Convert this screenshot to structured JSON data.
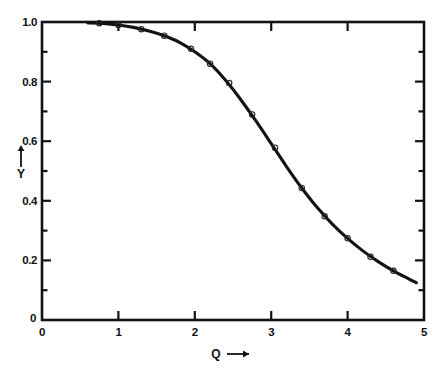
{
  "figure": {
    "background_color": "#ffffff",
    "line_color": "#121212",
    "marker_color": "#262626",
    "axis_color": "#121212"
  },
  "chart_data": {
    "type": "line",
    "title": "",
    "subtitle": "",
    "xlabel": "Q",
    "xlabel_suffix": "⟶",
    "ylabel": "Y",
    "ylabel_suffix": "⟶",
    "xlim": [
      0,
      5
    ],
    "ylim": [
      0,
      1.0
    ],
    "grid": false,
    "legend": null,
    "x_ticks": [
      0,
      1,
      2,
      3,
      4,
      5
    ],
    "x_tick_labels": [
      "0",
      "1",
      "2",
      "3",
      "4",
      "5"
    ],
    "x_minor_ticks": [
      0.5,
      1.5,
      2.5,
      3.5,
      4.5
    ],
    "y_ticks": [
      0,
      0.2,
      0.4,
      0.6,
      0.8,
      1.0
    ],
    "y_tick_labels": [
      "0",
      "0.2",
      "0.4",
      "0.6",
      "0.8",
      "1.0"
    ],
    "y_minor_ticks": [
      0.1,
      0.3,
      0.5,
      0.7,
      0.9
    ],
    "origin_x_label": "0",
    "origin_y_label": "0",
    "series": [
      {
        "name": "fitted curve",
        "style": "solid",
        "x": [
          0.6,
          0.8,
          1.0,
          1.2,
          1.4,
          1.6,
          1.8,
          2.0,
          2.2,
          2.4,
          2.6,
          2.8,
          3.0,
          3.2,
          3.4,
          3.6,
          3.8,
          4.0,
          4.2,
          4.4,
          4.6,
          4.8,
          4.9
        ],
        "y": [
          0.997,
          0.995,
          0.99,
          0.982,
          0.97,
          0.954,
          0.932,
          0.9,
          0.86,
          0.805,
          0.74,
          0.668,
          0.592,
          0.515,
          0.443,
          0.378,
          0.322,
          0.274,
          0.232,
          0.196,
          0.165,
          0.138,
          0.125
        ]
      },
      {
        "name": "measured points",
        "style": "markers",
        "marker": "open-circle",
        "x": [
          0.75,
          1.0,
          1.3,
          1.6,
          1.95,
          2.2,
          2.45,
          2.75,
          3.05,
          3.4,
          3.7,
          4.0,
          4.3,
          4.6
        ],
        "y": [
          0.996,
          0.99,
          0.976,
          0.954,
          0.91,
          0.86,
          0.795,
          0.69,
          0.578,
          0.443,
          0.348,
          0.274,
          0.212,
          0.165
        ]
      }
    ]
  }
}
